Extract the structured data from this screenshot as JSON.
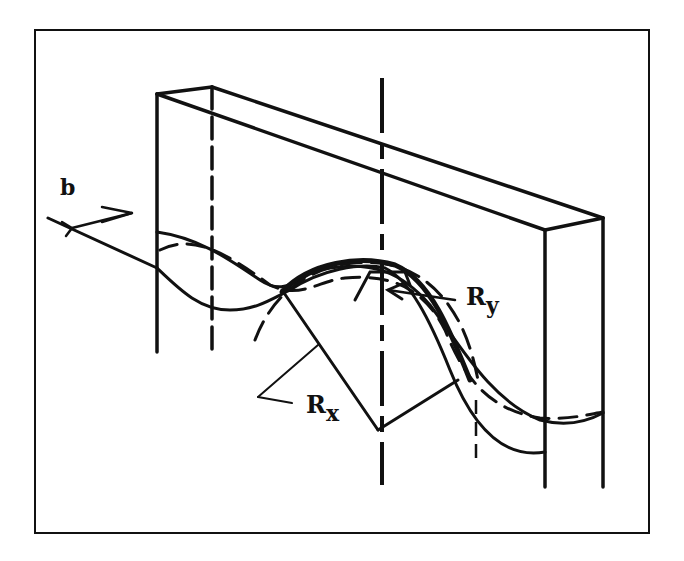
{
  "figure": {
    "labels": {
      "width_label": "b",
      "rx_main": "R",
      "rx_sub": "x",
      "ry_main": "R",
      "ry_sub": "y"
    },
    "colors": {
      "ink": "#111111",
      "background": "#ffffff"
    }
  }
}
